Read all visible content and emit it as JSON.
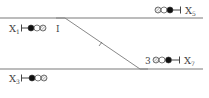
{
  "diagram": {
    "type": "railway-signal-layout",
    "colors": {
      "track": "#7a7a7a",
      "ink": "#444444",
      "background": "#ffffff"
    },
    "tracks": [
      {
        "id": "upper-main",
        "x1": 0,
        "y1": 18,
        "x2": 203,
        "y2": 18
      },
      {
        "id": "lower-main",
        "x1": 0,
        "y1": 69,
        "x2": 203,
        "y2": 69
      }
    ],
    "crossover": {
      "from": [
        65,
        18
      ],
      "to": [
        140,
        69
      ],
      "tail_to": [
        148,
        69
      ],
      "tick_at": [
        100,
        44
      ]
    },
    "signals": [
      {
        "id": "X1",
        "label": "X",
        "subscript": "1",
        "label_x": 9,
        "label_y": 32,
        "post_x": 21,
        "center_y": 28,
        "direction": "right",
        "lamps": [
          "filled",
          "open",
          "hatched"
        ],
        "lamp_start_x": 31,
        "insulated_joint": {
          "x": 57,
          "label": ""
        },
        "joint_label": "I"
      },
      {
        "id": "X5",
        "label": "X",
        "subscript": "5",
        "label_x": 185,
        "label_y": 14,
        "post_x": 180,
        "center_y": 10,
        "direction": "left",
        "lamps": [
          "hatched",
          "open",
          "filled"
        ],
        "lamp_start_x": 157
      },
      {
        "id": "X7",
        "label": "X",
        "subscript": "7",
        "label_x": 184,
        "label_y": 64,
        "post_x": 179,
        "center_y": 60,
        "direction": "left",
        "lamps": [
          "hatched",
          "open",
          "filled"
        ],
        "lamp_start_x": 155,
        "prefix": "3"
      },
      {
        "id": "X3",
        "label": "X",
        "subscript": "3",
        "label_x": 9,
        "label_y": 82,
        "post_x": 21,
        "center_y": 78,
        "direction": "right",
        "lamps": [
          "filled",
          "open",
          "hatched"
        ],
        "lamp_start_x": 32
      }
    ],
    "texts": {
      "x1_label": "X",
      "x1_sub": "1",
      "x1_joint": "I",
      "x5_label": "X",
      "x5_sub": "5",
      "x7_label": "X",
      "x7_sub": "7",
      "x7_prefix": "3",
      "x3_label": "X",
      "x3_sub": "3"
    }
  }
}
